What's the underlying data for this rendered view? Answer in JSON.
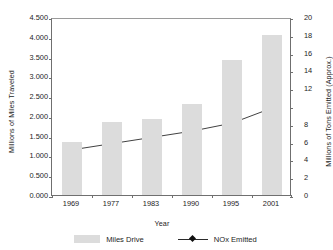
{
  "chart_data": {
    "type": "bar",
    "title": "",
    "subtitle": "",
    "xlabel": "Year",
    "ylabel": "Millions of Miles Traveled",
    "y2label": "Millions of Tons Emitted (Approx.)",
    "categories": [
      "1969",
      "1977",
      "1983",
      "1990",
      "1995",
      "2001"
    ],
    "ylim": [
      0,
      4.5
    ],
    "y2lim": [
      0,
      20
    ],
    "yticks": [
      "0.000",
      "0.500",
      "1.000",
      "1.500",
      "2.000",
      "2.500",
      "3.000",
      "3.500",
      "4.000",
      "4.500"
    ],
    "ytick_values": [
      0,
      0.5,
      1.0,
      1.5,
      2.0,
      2.5,
      3.0,
      3.5,
      4.0,
      4.5
    ],
    "y2ticks": [
      "0",
      "2",
      "4",
      "6",
      "8",
      "",
      "12",
      "14",
      "16",
      "18",
      "20"
    ],
    "y2tick_values": [
      0,
      2,
      4,
      6,
      8,
      10,
      12,
      14,
      16,
      18,
      20
    ],
    "grid": false,
    "legend_position": "bottom",
    "series": [
      {
        "name": "Miles Drive",
        "type": "bar",
        "axis": "left",
        "color": "#dcdcdc",
        "values": [
          1.35,
          1.85,
          1.93,
          2.29,
          3.42,
          4.05
        ]
      },
      {
        "name": "NOx Emitted",
        "type": "line",
        "axis": "right",
        "color": "#2b2b2b",
        "marker": "diamond",
        "values": [
          5.3,
          6.0,
          6.7,
          7.4,
          8.3,
          10.0
        ]
      }
    ]
  },
  "axes": {
    "left": {
      "title": "Millions of Miles Traveled",
      "labels": [
        "4.500",
        "4.000",
        "3.500",
        "3.000",
        "2.500",
        "2.000",
        "1.500",
        "1.000",
        "0.500",
        "0.000"
      ]
    },
    "right": {
      "title": "Millions of Tons Emitted (Approx.)",
      "labels": [
        "20",
        "18",
        "16",
        "14",
        "12",
        "",
        "8",
        "6",
        "4",
        "2",
        "0"
      ]
    },
    "bottom": {
      "title": "Year",
      "labels": [
        "1969",
        "1977",
        "1983",
        "1990",
        "1995",
        "2001"
      ]
    }
  },
  "legend": {
    "items": [
      {
        "label": "Miles Drive",
        "marker": "bar-swatch",
        "color": "#dcdcdc"
      },
      {
        "label": "NOx Emitted",
        "marker": "line-diamond",
        "color": "#2b2b2b"
      }
    ]
  },
  "colors": {
    "bar": "#dcdcdc",
    "line": "#2b2b2b",
    "axis": "#6f6f6f",
    "text": "#1d1d1d",
    "background": "#ffffff"
  }
}
